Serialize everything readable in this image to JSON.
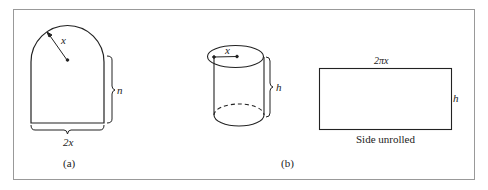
{
  "figure": {
    "panel_a": {
      "radius_label": "x",
      "height_label": "n",
      "width_label": "2x",
      "caption": "(a)"
    },
    "panel_b": {
      "radius_label": "x",
      "height_label": "h",
      "caption": "(b)"
    },
    "unrolled": {
      "width_label": "2πx",
      "height_label": "h",
      "caption": "Side unrolled"
    }
  }
}
